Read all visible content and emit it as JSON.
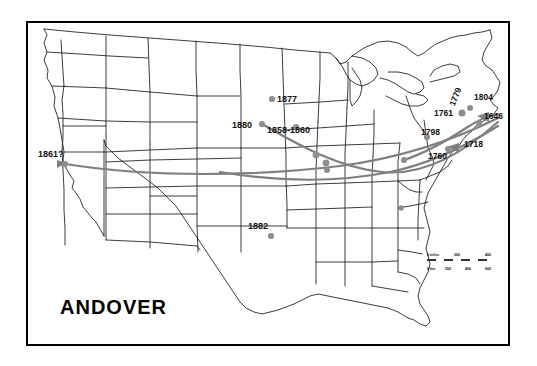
{
  "map": {
    "title": "ANDOVER",
    "type": "migration-map",
    "region": "Contiguous United States",
    "background_color": "#ffffff",
    "border_color": "#000000",
    "state_outline_color": "#1a1a1a",
    "route_color": "#7a7a7a",
    "marker_color": "#8a8a8a",
    "label_color": "#111111"
  },
  "scale_bar": {
    "miles_label": "0 miles",
    "miles_ticks": [
      "200",
      "400"
    ],
    "km_label": "0 km",
    "km_ticks": [
      "200",
      "400",
      "600"
    ]
  },
  "year_labels": [
    {
      "id": "1861q",
      "text": "1861?",
      "x": 38,
      "y": 152
    },
    {
      "id": "1877",
      "text": "1877",
      "x": 277,
      "y": 97
    },
    {
      "id": "1880",
      "text": "1880",
      "x": 233,
      "y": 123
    },
    {
      "id": "1858",
      "text": "1858-1860",
      "x": 269,
      "y": 129
    },
    {
      "id": "1882",
      "text": "1882",
      "x": 248,
      "y": 223
    },
    {
      "id": "1761",
      "text": "1761",
      "x": 437,
      "y": 111
    },
    {
      "id": "1779",
      "text": "1779",
      "x": 452,
      "y": 100,
      "rotation": -70
    },
    {
      "id": "1804",
      "text": "1804",
      "x": 477,
      "y": 95
    },
    {
      "id": "1646",
      "text": "1646",
      "x": 487,
      "y": 113
    },
    {
      "id": "1798",
      "text": "1798",
      "x": 424,
      "y": 130
    },
    {
      "id": "1718",
      "text": "1718",
      "x": 466,
      "y": 142
    },
    {
      "id": "1760",
      "text": "1760",
      "x": 430,
      "y": 153
    }
  ],
  "markers": [
    {
      "id": "m-1861",
      "x": 65,
      "y": 164
    },
    {
      "id": "m-1877",
      "x": 272,
      "y": 99
    },
    {
      "id": "m-1880",
      "x": 262,
      "y": 124
    },
    {
      "id": "m-1858",
      "x": 296,
      "y": 127
    },
    {
      "id": "m-1882",
      "x": 271,
      "y": 236
    },
    {
      "id": "m-il-a",
      "x": 316,
      "y": 155
    },
    {
      "id": "m-il-b",
      "x": 326,
      "y": 163
    },
    {
      "id": "m-il-c",
      "x": 327,
      "y": 169
    },
    {
      "id": "m-oh",
      "x": 404,
      "y": 160
    },
    {
      "id": "m-ny",
      "x": 462,
      "y": 113
    },
    {
      "id": "m-ne",
      "x": 469,
      "y": 109
    },
    {
      "id": "m-pa",
      "x": 427,
      "y": 137
    },
    {
      "id": "m-ma",
      "x": 479,
      "y": 123
    },
    {
      "id": "m-nj",
      "x": 448,
      "y": 148
    },
    {
      "id": "m-va",
      "x": 401,
      "y": 208
    }
  ]
}
